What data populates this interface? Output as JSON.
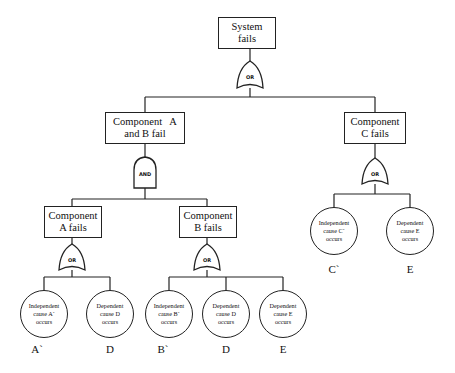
{
  "top_event": {
    "line1": "System",
    "line2": "fails"
  },
  "gates": {
    "top": "OR",
    "ab": "AND",
    "a": "OR",
    "b": "OR",
    "c": "OR"
  },
  "intermediate": {
    "ab": {
      "line1": "Component   A",
      "line2": "and B fail"
    },
    "c": {
      "line1": "Component",
      "line2": "C fails"
    },
    "a": {
      "line1": "Component",
      "line2": "A fails"
    },
    "b": {
      "line1": "Component",
      "line2": "B fails"
    }
  },
  "basic_events": [
    {
      "l1": "Independent",
      "l2": "cause A`",
      "l3": "occurs",
      "tag": "A`"
    },
    {
      "l1": "Dependent",
      "l2": "cause D",
      "l3": "occurs",
      "tag": "D"
    },
    {
      "l1": "Independent",
      "l2": "cause B`",
      "l3": "occurs",
      "tag": "B`"
    },
    {
      "l1": "Dependent",
      "l2": "cause D",
      "l3": "occurs",
      "tag": "D"
    },
    {
      "l1": "Dependent",
      "l2": "cause E",
      "l3": "occurs",
      "tag": "E"
    },
    {
      "l1": "Independent",
      "l2": "cause C`",
      "l3": "occurs",
      "tag": "C`"
    },
    {
      "l1": "Dependent",
      "l2": "cause E",
      "l3": "occurs",
      "tag": "E"
    }
  ]
}
